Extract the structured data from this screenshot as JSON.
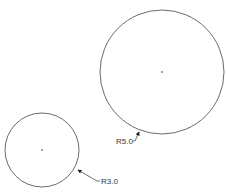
{
  "drawing": {
    "circles": [
      {
        "id": "large",
        "cx": 162,
        "cy": 72,
        "r": 62,
        "dimension": "R5.0"
      },
      {
        "id": "small",
        "cx": 42,
        "cy": 150,
        "r": 37,
        "dimension": "R3.0"
      }
    ],
    "colors": {
      "line": "#333333",
      "background": "#ffffff"
    }
  }
}
